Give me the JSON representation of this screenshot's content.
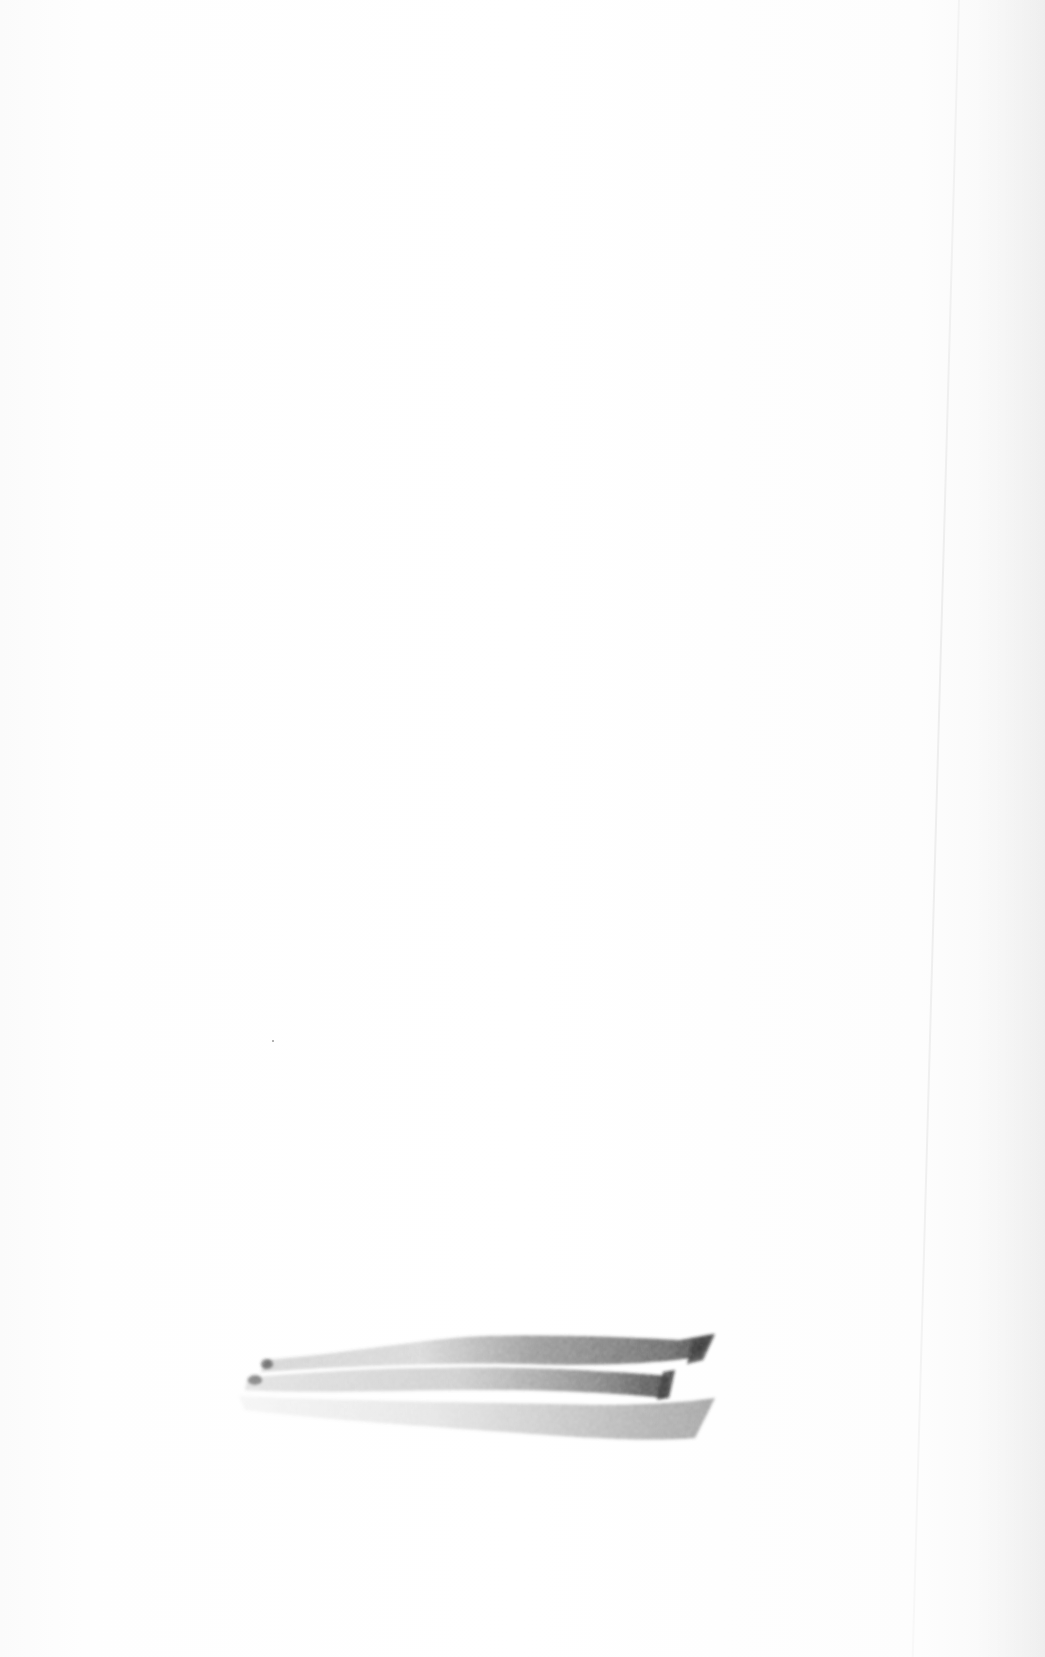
{
  "scene": {
    "description": "Blank white sheet of paper with a graphite/charcoal smudge near the bottom",
    "background_color": "#fdfdfd",
    "smudge": {
      "color": "#3a3a3a",
      "position": {
        "x": 235,
        "y": 1330,
        "width": 480,
        "height": 115
      }
    },
    "crease": {
      "x": 958
    }
  }
}
